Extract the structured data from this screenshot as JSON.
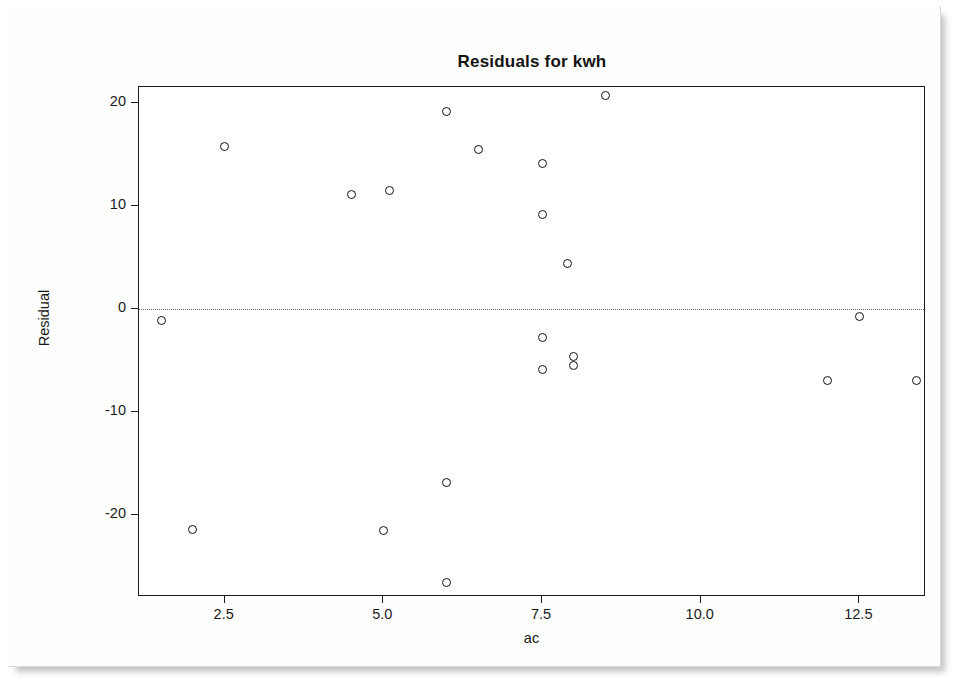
{
  "chart_data": {
    "type": "scatter",
    "title": "Residuals for kwh",
    "xlabel": "ac",
    "ylabel": "Residual",
    "grid": false,
    "legend": null,
    "reference_line": {
      "axis": "y",
      "value": 0,
      "style": "dotted"
    },
    "xlim": [
      1.15,
      13.55
    ],
    "ylim": [
      -28.0,
      21.6
    ],
    "xticks": [
      2.5,
      5.0,
      7.5,
      10.0,
      12.5
    ],
    "xtick_labels": [
      "2.5",
      "5.0",
      "7.5",
      "10.0",
      "12.5"
    ],
    "yticks": [
      20,
      10,
      0,
      -10,
      -20
    ],
    "ytick_labels": [
      "20",
      "10",
      "0",
      "-10",
      "-20"
    ],
    "marker": "open-circle",
    "marker_color": "#111111",
    "points": [
      {
        "x": 1.5,
        "y": -1.1
      },
      {
        "x": 2.0,
        "y": -21.4
      },
      {
        "x": 2.5,
        "y": 15.8
      },
      {
        "x": 4.5,
        "y": 11.1
      },
      {
        "x": 5.0,
        "y": -21.5
      },
      {
        "x": 5.1,
        "y": 11.5
      },
      {
        "x": 6.0,
        "y": 19.2
      },
      {
        "x": 6.0,
        "y": -16.9
      },
      {
        "x": 6.0,
        "y": -26.6
      },
      {
        "x": 6.5,
        "y": 15.5
      },
      {
        "x": 7.5,
        "y": 14.2
      },
      {
        "x": 7.5,
        "y": 9.2
      },
      {
        "x": 7.5,
        "y": -2.8
      },
      {
        "x": 7.5,
        "y": -5.9
      },
      {
        "x": 7.9,
        "y": 4.4
      },
      {
        "x": 8.0,
        "y": -4.6
      },
      {
        "x": 8.0,
        "y": -5.5
      },
      {
        "x": 8.5,
        "y": 20.8
      },
      {
        "x": 12.0,
        "y": -6.9
      },
      {
        "x": 12.5,
        "y": -0.7
      },
      {
        "x": 13.4,
        "y": -6.9
      }
    ]
  },
  "figure": {
    "title": "Residuals for kwh",
    "xlabel": "ac",
    "ylabel": "Residual"
  }
}
